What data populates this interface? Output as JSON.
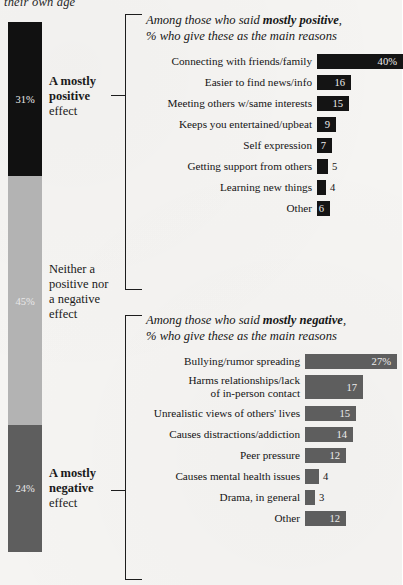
{
  "top_caption": "their own age",
  "colors": {
    "positive": "#111111",
    "neutral": "#b3b3b3",
    "negative": "#5e5e5e",
    "background": "#f5f4f2"
  },
  "stacked_bar": {
    "segments": [
      {
        "key": "positive",
        "value": "31%",
        "label_strong": "A mostly",
        "label_bold": "positive",
        "label_rest": "effect"
      },
      {
        "key": "neutral",
        "value": "45%",
        "label_line1": "Neither a",
        "label_line2": "positive nor",
        "label_line3": "a negative",
        "label_line4": "effect"
      },
      {
        "key": "negative",
        "value": "24%",
        "label_strong": "A mostly",
        "label_bold": "negative",
        "label_rest": "effect"
      }
    ]
  },
  "panels": [
    {
      "title_pre": "Among those who said ",
      "title_bold": "mostly positive",
      "title_post": ",",
      "title_line2": "% who give these as the main reasons"
    },
    {
      "title_pre": "Among those who said ",
      "title_bold": "mostly negative",
      "title_post": ",",
      "title_line2": "% who give these as the main reasons"
    }
  ],
  "chart_data": [
    {
      "type": "bar",
      "orientation": "horizontal",
      "title": "Among those who said mostly positive, % who give these as the main reasons",
      "xlabel": "",
      "ylabel": "",
      "xlim": [
        0,
        40
      ],
      "grid": false,
      "legend": "none",
      "bar_color": "#141414",
      "categories": [
        "Connecting with friends/family",
        "Easier to find news/info",
        "Meeting others w/same interests",
        "Keeps you entertained/upbeat",
        "Self expression",
        "Getting support from others",
        "Learning new things",
        "Other"
      ],
      "values": [
        40,
        16,
        15,
        9,
        7,
        5,
        4,
        6
      ],
      "value_labels": [
        "40%",
        "16",
        "15",
        "9",
        "7",
        "5",
        "4",
        "6"
      ],
      "label_placement": [
        "inside",
        "inside",
        "inside",
        "inside",
        "inside",
        "outside",
        "outside",
        "inside"
      ]
    },
    {
      "type": "bar",
      "orientation": "horizontal",
      "title": "Among those who said mostly negative, % who give these as the main reasons",
      "xlabel": "",
      "ylabel": "",
      "xlim": [
        0,
        27
      ],
      "grid": false,
      "legend": "none",
      "bar_color": "#5e5e5e",
      "categories": [
        "Bullying/rumor spreading",
        "Harms relationships/lack\nof in-person contact",
        "Unrealistic views of others' lives",
        "Causes distractions/addiction",
        "Peer pressure",
        "Causes mental health issues",
        "Drama, in general",
        "Other"
      ],
      "values": [
        27,
        17,
        15,
        14,
        12,
        4,
        3,
        12
      ],
      "value_labels": [
        "27%",
        "17",
        "15",
        "14",
        "12",
        "4",
        "3",
        "12"
      ],
      "label_placement": [
        "inside",
        "inside",
        "inside",
        "inside",
        "inside",
        "outside",
        "outside",
        "inside"
      ]
    }
  ]
}
